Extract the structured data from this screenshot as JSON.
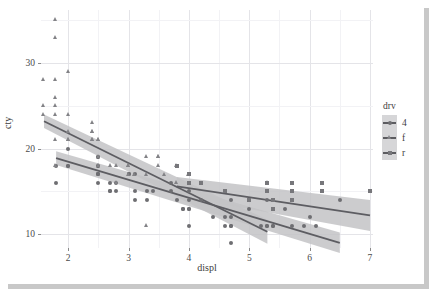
{
  "chart_data": {
    "type": "scatter",
    "title": "",
    "xlabel": "displ",
    "ylabel": "cty",
    "xlim": [
      1.55,
      7.05
    ],
    "ylim": [
      8.4,
      36.2
    ],
    "xticks": [
      "2",
      "3",
      "4",
      "5",
      "6",
      "7"
    ],
    "xtick_values": [
      2,
      3,
      4,
      5,
      6,
      7
    ],
    "yticks": [
      "10",
      "20",
      "30"
    ],
    "ytick_values": [
      10,
      20,
      30
    ],
    "grid": true,
    "legend": {
      "title": "drv",
      "position": "right",
      "entries": [
        {
          "label": "4",
          "shape": "circle",
          "color": "#6e6e72"
        },
        {
          "label": "f",
          "shape": "triangle",
          "color": "#828286"
        },
        {
          "label": "r",
          "shape": "square",
          "color": "#77777b"
        }
      ]
    },
    "smoother": {
      "method": "lm",
      "confidence_band": true,
      "band_color": "#c3c3c6"
    },
    "series": [
      {
        "name": "4",
        "shape": "circle",
        "color": "#6e6e72",
        "fit": {
          "x": [
            1.8,
            6.5
          ],
          "y": [
            18.9,
            9.0
          ],
          "ci_lo": [
            18.1,
            7.8
          ],
          "ci_hi": [
            19.7,
            10.2
          ]
        },
        "points": [
          [
            1.8,
            18
          ],
          [
            1.8,
            16
          ],
          [
            2.0,
            20
          ],
          [
            2.0,
            18
          ],
          [
            2.0,
            18
          ],
          [
            2.5,
            19
          ],
          [
            2.5,
            19
          ],
          [
            2.5,
            18
          ],
          [
            2.5,
            17
          ],
          [
            2.5,
            17
          ],
          [
            2.5,
            18
          ],
          [
            2.5,
            17
          ],
          [
            2.5,
            16
          ],
          [
            2.7,
            16
          ],
          [
            2.7,
            15
          ],
          [
            2.7,
            15
          ],
          [
            2.8,
            16
          ],
          [
            2.8,
            15
          ],
          [
            3.0,
            17
          ],
          [
            3.0,
            17
          ],
          [
            3.1,
            17
          ],
          [
            3.1,
            15
          ],
          [
            3.1,
            14
          ],
          [
            3.3,
            15
          ],
          [
            3.3,
            14
          ],
          [
            3.4,
            15
          ],
          [
            3.7,
            15
          ],
          [
            3.7,
            16
          ],
          [
            3.8,
            14
          ],
          [
            3.9,
            13
          ],
          [
            3.9,
            13
          ],
          [
            4.0,
            15
          ],
          [
            4.0,
            14
          ],
          [
            4.0,
            13
          ],
          [
            4.0,
            13
          ],
          [
            4.0,
            11
          ],
          [
            4.2,
            16
          ],
          [
            4.2,
            14
          ],
          [
            4.4,
            12
          ],
          [
            4.6,
            12
          ],
          [
            4.6,
            11
          ],
          [
            4.7,
            14
          ],
          [
            4.7,
            12
          ],
          [
            4.7,
            11
          ],
          [
            4.7,
            11
          ],
          [
            4.7,
            9
          ],
          [
            5.0,
            13
          ],
          [
            5.2,
            11
          ],
          [
            5.3,
            11
          ],
          [
            5.3,
            11
          ],
          [
            5.3,
            14
          ],
          [
            5.4,
            11
          ],
          [
            5.4,
            11
          ],
          [
            5.6,
            13
          ],
          [
            5.7,
            11
          ],
          [
            5.9,
            11
          ],
          [
            6.0,
            12
          ],
          [
            6.1,
            11
          ],
          [
            6.5,
            14
          ]
        ]
      },
      {
        "name": "f",
        "shape": "triangle",
        "color": "#828286",
        "fit": {
          "x": [
            1.6,
            5.3
          ],
          "y": [
            23.2,
            10.3
          ],
          "ci_lo": [
            22.4,
            8.9
          ],
          "ci_hi": [
            24.0,
            11.7
          ]
        },
        "points": [
          [
            1.6,
            24
          ],
          [
            1.6,
            25
          ],
          [
            1.6,
            28
          ],
          [
            1.8,
            24
          ],
          [
            1.8,
            25
          ],
          [
            1.8,
            26
          ],
          [
            1.8,
            28
          ],
          [
            1.8,
            33
          ],
          [
            1.8,
            35
          ],
          [
            1.8,
            18
          ],
          [
            1.8,
            21
          ],
          [
            2.0,
            29
          ],
          [
            2.0,
            24
          ],
          [
            2.0,
            22
          ],
          [
            2.0,
            21
          ],
          [
            2.0,
            21
          ],
          [
            2.4,
            22
          ],
          [
            2.4,
            22
          ],
          [
            2.4,
            21
          ],
          [
            2.4,
            21
          ],
          [
            2.4,
            23
          ],
          [
            2.5,
            21
          ],
          [
            2.5,
            21
          ],
          [
            2.5,
            19
          ],
          [
            2.5,
            18
          ],
          [
            2.5,
            18
          ],
          [
            2.7,
            18
          ],
          [
            2.8,
            18
          ],
          [
            2.8,
            16
          ],
          [
            3.0,
            18
          ],
          [
            3.0,
            18
          ],
          [
            3.0,
            17
          ],
          [
            3.1,
            17
          ],
          [
            3.3,
            17
          ],
          [
            3.3,
            19
          ],
          [
            3.3,
            11
          ],
          [
            3.5,
            19
          ],
          [
            3.5,
            19
          ],
          [
            3.5,
            18
          ],
          [
            3.6,
            17
          ],
          [
            3.8,
            18
          ],
          [
            3.8,
            16
          ],
          [
            4.0,
            17
          ],
          [
            5.3,
            16
          ]
        ]
      },
      {
        "name": "r",
        "shape": "square",
        "color": "#77777b",
        "fit": {
          "x": [
            3.8,
            7.0
          ],
          "y": [
            15.6,
            12.2
          ],
          "ci_lo": [
            14.5,
            10.4
          ],
          "ci_hi": [
            16.7,
            14.0
          ]
        },
        "points": [
          [
            3.8,
            18
          ],
          [
            4.0,
            17
          ],
          [
            4.0,
            16
          ],
          [
            4.2,
            16
          ],
          [
            4.6,
            15
          ],
          [
            5.0,
            14
          ],
          [
            5.3,
            16
          ],
          [
            5.3,
            15
          ],
          [
            5.4,
            14
          ],
          [
            5.4,
            13
          ],
          [
            5.7,
            16
          ],
          [
            5.7,
            15
          ],
          [
            5.7,
            14
          ],
          [
            6.2,
            16
          ],
          [
            6.2,
            15
          ],
          [
            7.0,
            15
          ]
        ]
      }
    ]
  },
  "axes": {
    "x_title": "displ",
    "y_title": "cty"
  }
}
